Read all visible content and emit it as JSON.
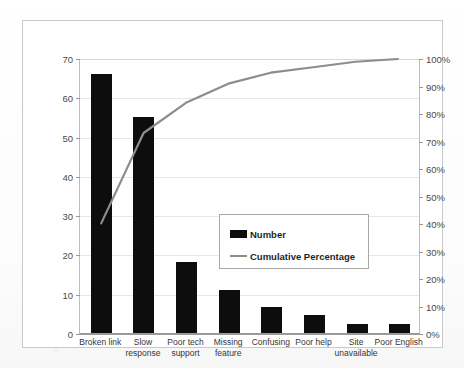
{
  "chart_data": {
    "type": "bar",
    "title": "",
    "subtitle": "",
    "xlabel": "",
    "ylabel": "",
    "y2label": "",
    "categories": [
      "Broken link",
      "Slow response",
      "Poor tech support",
      "Missing feature",
      "Confusing",
      "Poor help",
      "Site unavailable",
      "Poor English"
    ],
    "category_lines": [
      [
        "Broken link"
      ],
      [
        "Slow",
        "response"
      ],
      [
        "Poor tech",
        "support"
      ],
      [
        "Missing",
        "feature"
      ],
      [
        "Confusing"
      ],
      [
        "Poor help"
      ],
      [
        "Site",
        "unavailable"
      ],
      [
        "Poor English"
      ]
    ],
    "series": [
      {
        "name": "Number",
        "type": "bar",
        "axis": "left",
        "color": "#0d0d0d",
        "values": [
          66,
          55,
          18,
          11,
          6.5,
          4.5,
          2.3,
          2.3
        ]
      },
      {
        "name": "Cumulative Percentage",
        "type": "line",
        "axis": "right",
        "color": "#8d8d8d",
        "values": [
          40,
          73,
          84,
          91,
          95,
          97,
          99,
          100
        ]
      }
    ],
    "ylim": [
      0,
      70
    ],
    "y2lim": [
      0,
      100
    ],
    "yticks": [
      0,
      10,
      20,
      30,
      40,
      50,
      60,
      70
    ],
    "ytick_labels": [
      "0",
      "10",
      "20",
      "30",
      "40",
      "50",
      "60",
      "70"
    ],
    "y2ticks": [
      0,
      10,
      20,
      30,
      40,
      50,
      60,
      70,
      80,
      90,
      100
    ],
    "y2tick_labels": [
      "0%",
      "10%",
      "20%",
      "30%",
      "40%",
      "50%",
      "60%",
      "70%",
      "80%",
      "90%",
      "100%"
    ],
    "grid": true,
    "grid_axis": "y",
    "legend": {
      "position": "center",
      "entries": [
        {
          "label": "Number",
          "marker": "bar-swatch",
          "color": "#0d0d0d"
        },
        {
          "label": "Cumulative Percentage",
          "marker": "line-swatch",
          "color": "#8d8d8d"
        }
      ]
    },
    "colors": {
      "bar": "#0d0d0d",
      "line": "#8d8d8d",
      "grid": "#e6e6e6",
      "axis": "#9a9a9a",
      "frame": "#c9c9c9",
      "text": "#3a3a3a",
      "background": "#ffffff"
    }
  }
}
